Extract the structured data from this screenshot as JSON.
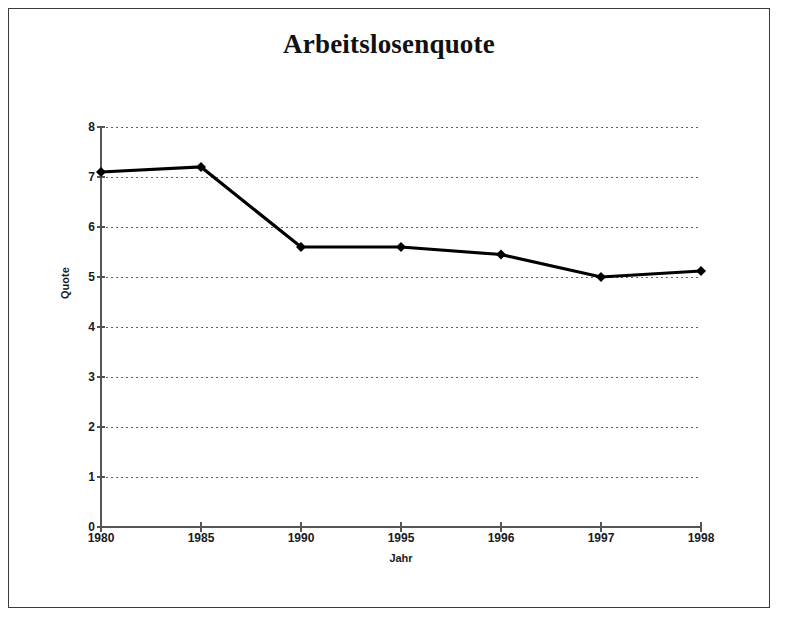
{
  "frame": {
    "border_color": "#3b3b3b",
    "background": "#ffffff"
  },
  "chart_data": {
    "type": "line",
    "title": "Arbeitslosenquote",
    "xlabel": "Jahr",
    "ylabel": "Quote",
    "categories": [
      "1980",
      "1985",
      "1990",
      "1995",
      "1996",
      "1997",
      "1998"
    ],
    "values": [
      7.1,
      7.2,
      5.6,
      5.6,
      5.45,
      5.0,
      5.12
    ],
    "series": [
      {
        "name": "Arbeitslosenquote",
        "values": [
          7.1,
          7.2,
          5.6,
          5.6,
          5.45,
          5.0,
          5.12
        ],
        "line_color": "#000000",
        "marker": "diamond"
      }
    ],
    "ylim": [
      0,
      8
    ],
    "ytick_labels": [
      "0",
      "1",
      "2",
      "3",
      "4",
      "5",
      "6",
      "7",
      "8"
    ],
    "ytick_values": [
      0,
      1,
      2,
      3,
      4,
      5,
      6,
      7,
      8
    ],
    "grid": "horizontal-dotted",
    "grid_color": "#5a5a8a",
    "legend": "none",
    "axis_color": "#555555"
  }
}
